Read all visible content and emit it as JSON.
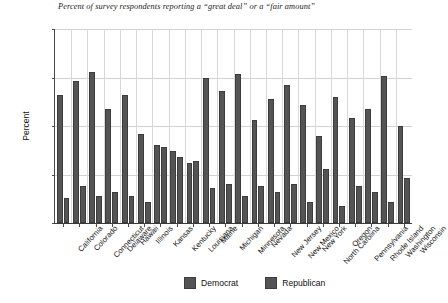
{
  "chart_data": {
    "type": "bar",
    "title": "Percent of survey respondents reporting a “great deal” or a “fair amount”",
    "xlabel": "",
    "ylabel": "Percent",
    "ylim": [
      0,
      100
    ],
    "yticks": [
      0,
      25,
      50,
      75,
      100
    ],
    "grid": true,
    "legend_position": "bottom-center",
    "categories": [
      "California",
      "Colorado",
      "Connecticut",
      "Delaware",
      "Hawaii",
      "Illinois",
      "Kansas",
      "Kentucky",
      "Louisiana",
      "Maine",
      "Michigan",
      "Minnesota",
      "Nevada",
      "New Jersey",
      "New Mexico",
      "New York",
      "North Carolina",
      "Oregon",
      "Pennsylvania",
      "Rhode Island",
      "Washington",
      "Wisconsin"
    ],
    "series": [
      {
        "name": "Democrat",
        "color": "#545454",
        "values": [
          66,
          73,
          78,
          59,
          66,
          46,
          40,
          37,
          31,
          75,
          68,
          77,
          53,
          64,
          71,
          61,
          45,
          65,
          54,
          59,
          76,
          50
        ]
      },
      {
        "name": "Republican",
        "color": "#545454",
        "values": [
          13,
          19,
          14,
          16,
          14,
          11,
          39,
          34,
          32,
          18,
          20,
          14,
          19,
          16,
          20,
          11,
          28,
          9,
          19,
          16,
          11,
          23
        ]
      }
    ]
  },
  "legend": {
    "items": [
      {
        "label": "Democrat",
        "swatch_name": "legend-swatch-democrat"
      },
      {
        "label": "Republican",
        "swatch_name": "legend-swatch-republican"
      }
    ]
  },
  "axis": {
    "y_title": "Percent",
    "y_tick_labels": [
      "100",
      "75",
      "50",
      "25",
      "0"
    ]
  }
}
